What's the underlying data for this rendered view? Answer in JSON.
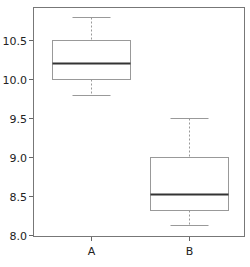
{
  "chart_data": {
    "type": "box",
    "title": "",
    "xlabel": "",
    "ylabel": "",
    "ylim": [
      8.0,
      10.9
    ],
    "yticks": [
      8.0,
      8.5,
      9.0,
      9.5,
      10.0,
      10.5
    ],
    "ytick_labels": [
      "8.0",
      "8.5",
      "9.0",
      "9.5",
      "10.0",
      "10.5"
    ],
    "categories": [
      "A",
      "B"
    ],
    "series": [
      {
        "name": "A",
        "min": 9.8,
        "q1": 10.0,
        "median": 10.2,
        "q3": 10.5,
        "max": 10.8
      },
      {
        "name": "B",
        "min": 8.13,
        "q1": 8.32,
        "median": 8.52,
        "q3": 9.0,
        "max": 9.5
      }
    ],
    "grid": false,
    "legend": "none"
  },
  "colors": {
    "box": "#999999",
    "median": "#333333",
    "whisker": "#999999",
    "axis": "#666666"
  }
}
